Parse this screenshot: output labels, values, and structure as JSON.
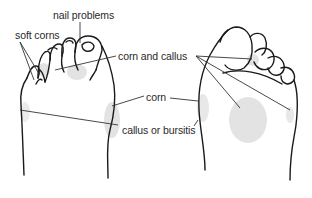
{
  "diagram": {
    "labels": {
      "nail_problems": "nail problems",
      "soft_corns": "soft corns",
      "corn_and_callus": "corn and callus",
      "corn": "corn",
      "callus_or_bursitis": "callus or bursitis"
    },
    "colors": {
      "outline": "#1a1a1a",
      "shading": "#e3e3e3",
      "leader_line": "#333333",
      "label_text": "#2a2a2a"
    }
  }
}
